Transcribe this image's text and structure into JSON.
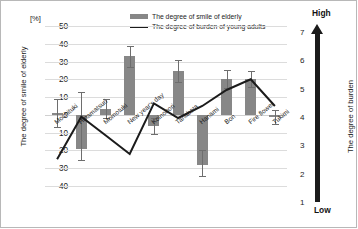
{
  "chart_data": {
    "type": "bar",
    "title": "",
    "unit_label": "[%]",
    "categories": [
      "Mochituki",
      "Hinamatsuri",
      "Momotuki",
      "New year's day",
      "Koinobori",
      "Tanabata",
      "Hanami",
      "Bon",
      "Fire flower",
      "Tukimi"
    ],
    "series": [
      {
        "name": "The degree of smile of elderly",
        "type": "bar",
        "axis": "left",
        "color": "#878787",
        "values": [
          1,
          -19,
          3.5,
          33,
          -6,
          24.5,
          -28,
          20,
          20,
          -1
        ],
        "errors_upper": [
          9,
          13,
          9,
          38.5,
          -1.5,
          31,
          -20,
          25,
          24.5,
          3
        ],
        "errors_lower": [
          -7,
          -25.5,
          -2,
          27,
          -11,
          18.5,
          -34.5,
          15,
          15.5,
          -5
        ]
      },
      {
        "name": "The degree of burden of young adults",
        "type": "line",
        "axis": "right",
        "color": "#1b1b1b",
        "values": [
          2.0,
          3.6,
          2.9,
          2.2,
          4.1,
          3.55,
          4.0,
          4.6,
          5.0,
          4.0
        ]
      }
    ],
    "xlabel": "",
    "ylabel": "The degree of smile of elderly",
    "ylim": [
      -40,
      50
    ],
    "yticks": [
      50,
      40,
      30,
      20,
      10,
      0,
      -10,
      -20,
      -30,
      -40
    ],
    "y2label": "The degree of burden",
    "y2lim": [
      1,
      7
    ],
    "y2ticks": [
      7,
      6,
      5,
      4,
      3,
      2,
      1
    ],
    "y2_top_label": "High",
    "y2_bottom_label": "Low",
    "grid": true,
    "legend_position": "top-center"
  },
  "legend": {
    "bar_label": "The degree of smile of elderly",
    "line_label": "The degree of burden of young adults"
  },
  "left_axis": {
    "title": "The degree of smile of elderly",
    "unit": "[%]"
  },
  "right_axis": {
    "title": "The degree of burden",
    "high": "High",
    "low": "Low"
  }
}
